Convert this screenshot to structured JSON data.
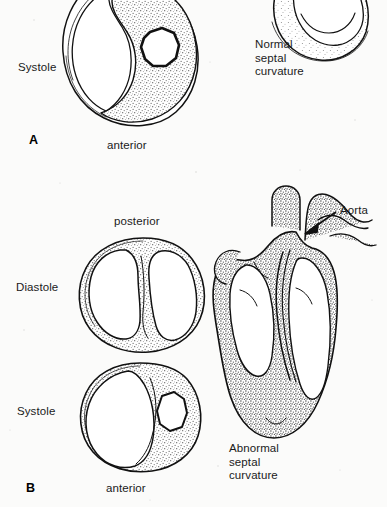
{
  "figure": {
    "background_color": "#fbfbfa",
    "ink_color": "#111111",
    "stipple_color": "#5d5d5d"
  },
  "panel_a": {
    "letter": "A",
    "phase_label_top": "",
    "phase_label_systole": "Systole",
    "orientation_label_bottom": "anterior",
    "caption": "Normal\nseptal\ncurvature",
    "caption_lines": [
      "Normal",
      "septal",
      "curvature"
    ]
  },
  "panel_b": {
    "letter": "B",
    "orientation_label_top": "posterior",
    "phase_label_diastole": "Diastole",
    "phase_label_systole": "Systole",
    "orientation_label_bottom": "anterior",
    "caption": "Abnormal\nseptal\ncurvature",
    "caption_lines": [
      "Abnormal",
      "septal",
      "curvature"
    ],
    "annotation_aorta": "Aorta"
  }
}
